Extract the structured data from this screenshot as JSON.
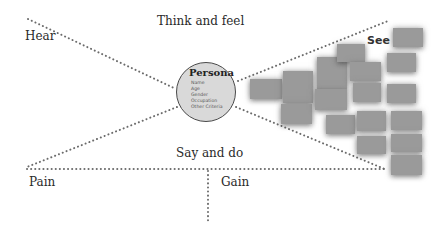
{
  "diagram": {
    "quadrants": {
      "top": "Think and feel",
      "left": "Hear",
      "right": "See",
      "bottom": "Say and do"
    },
    "bottom_sections": {
      "left": "Pain",
      "right": "Gain"
    },
    "center": {
      "title": "Persona",
      "attributes": [
        "Name",
        "Age",
        "Gender",
        "Occupation",
        "Other Criteria"
      ]
    },
    "colors": {
      "line": "#6b6b6b",
      "persona_fill": "#d9d9d9",
      "persona_border": "#4a4a4a",
      "card_fill": "#9a9a9a",
      "text": "#2a2a2a"
    },
    "see_cards": [
      {
        "x": 250,
        "y": 79,
        "w": 32,
        "h": 20
      },
      {
        "x": 283,
        "y": 71,
        "w": 30,
        "h": 32
      },
      {
        "x": 281,
        "y": 104,
        "w": 31,
        "h": 20
      },
      {
        "x": 317,
        "y": 57,
        "w": 30,
        "h": 32
      },
      {
        "x": 337,
        "y": 44,
        "w": 28,
        "h": 18
      },
      {
        "x": 350,
        "y": 62,
        "w": 31,
        "h": 19
      },
      {
        "x": 315,
        "y": 89,
        "w": 32,
        "h": 21
      },
      {
        "x": 353,
        "y": 83,
        "w": 28,
        "h": 19
      },
      {
        "x": 393,
        "y": 28,
        "w": 30,
        "h": 19
      },
      {
        "x": 387,
        "y": 53,
        "w": 29,
        "h": 19
      },
      {
        "x": 387,
        "y": 84,
        "w": 29,
        "h": 19
      },
      {
        "x": 326,
        "y": 115,
        "w": 29,
        "h": 19
      },
      {
        "x": 357,
        "y": 111,
        "w": 29,
        "h": 20
      },
      {
        "x": 391,
        "y": 111,
        "w": 31,
        "h": 19
      },
      {
        "x": 357,
        "y": 136,
        "w": 29,
        "h": 18
      },
      {
        "x": 391,
        "y": 134,
        "w": 31,
        "h": 18
      },
      {
        "x": 391,
        "y": 155,
        "w": 31,
        "h": 20
      }
    ]
  }
}
